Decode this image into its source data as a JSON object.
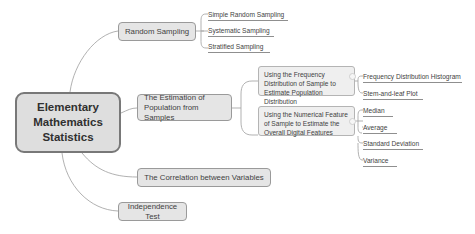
{
  "diagram": {
    "type": "mind-map",
    "title": "Elementary Mathematics Statistics",
    "root": {
      "label": "Elementary\nMathematics\nStatistics",
      "line1": "Elementary",
      "line2": "Mathematics",
      "line3": "Statistics"
    },
    "colors": {
      "background": "#ffffff",
      "root_fill": "#dedede",
      "root_border": "#787878",
      "node_fill": "#e5e5e5",
      "node_border": "#9a9a9a",
      "subnode_fill": "#efefef",
      "subnode_border": "#b4b4b4",
      "connector": "#a8a8a8",
      "text": "#3f3f3f",
      "underline": "#8f8f8f"
    },
    "branches": [
      {
        "id": "random-sampling",
        "label": "Random Sampling",
        "children": [
          {
            "id": "simple-random-sampling",
            "label": "Simple Random Sampling"
          },
          {
            "id": "systematic-sampling",
            "label": "Systematic Sampling"
          },
          {
            "id": "stratified-sampling",
            "label": "Stratified Sampling"
          }
        ]
      },
      {
        "id": "estimation-of-population",
        "label": "The Estimation of Population from Samples",
        "children": [
          {
            "id": "frequency-distribution-method",
            "label": "Using the Frequency Distribution of Sample to Estimate Population Distribution",
            "children": [
              {
                "id": "frequency-distribution-histogram",
                "label": "Frequency Distribution Histogram"
              },
              {
                "id": "stem-and-leaf-plot",
                "label": "Stem-and-leaf Plot"
              }
            ]
          },
          {
            "id": "numerical-feature-method",
            "label": "Using the Numerical Feature of Sample to Estimate the Overall Digital Features",
            "children": [
              {
                "id": "median",
                "label": "Median"
              },
              {
                "id": "average",
                "label": "Average"
              },
              {
                "id": "standard-deviation",
                "label": "Standard Deviation"
              },
              {
                "id": "variance",
                "label": "Variance"
              }
            ]
          }
        ]
      },
      {
        "id": "correlation-between-variables",
        "label": "The Correlation between Variables",
        "children": []
      },
      {
        "id": "independence-test",
        "label": "Independence Test",
        "children": []
      }
    ]
  }
}
